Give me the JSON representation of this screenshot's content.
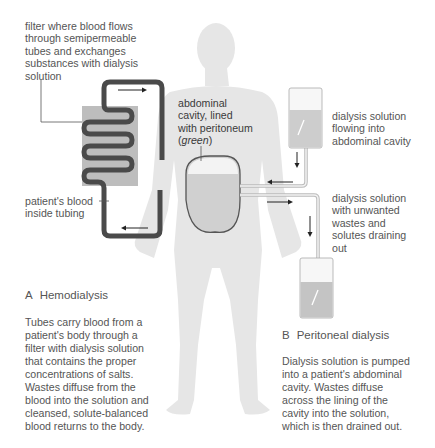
{
  "colors": {
    "body": "#e6e6e6",
    "tubing": "#4a4a4a",
    "filter": "#bdbdbd",
    "peritoneum_outline": "#555555",
    "abdomen_fill": "#cfcfcf",
    "solution": "#cccccc",
    "bag_outline": "#a8a8a8",
    "text": "#555555"
  },
  "labels": {
    "filter": [
      "filter where blood flows",
      "through semipermeable",
      "tubes and exchanges",
      "substances with dialysis",
      "solution"
    ],
    "blood": [
      "patient's blood",
      "inside tubing"
    ],
    "abdominal": [
      "abdominal",
      "cavity, lined",
      "with peritoneum"
    ],
    "abdominal_green": "green",
    "flowing_in": [
      "dialysis solution",
      "flowing into",
      "abdominal cavity"
    ],
    "draining": [
      "dialysis solution",
      "with unwanted",
      "wastes and",
      "solutes draining",
      "out"
    ]
  },
  "section_a": {
    "letter": "A",
    "title": "Hemodialysis",
    "text": [
      "Tubes carry blood from a",
      "patient's body through a",
      "filter with dialysis solution",
      "that contains the proper",
      "concentrations of salts.",
      "Wastes diffuse from the",
      "blood into the solution and",
      "cleansed, solute-balanced",
      "blood returns to the body."
    ]
  },
  "section_b": {
    "letter": "B",
    "title": "Peritoneal dialysis",
    "text": [
      "Dialysis solution is pumped",
      "into a patient's abdominal",
      "cavity. Wastes diffuse",
      "across the lining of the",
      "cavity into the solution,",
      "which is then drained out."
    ]
  }
}
